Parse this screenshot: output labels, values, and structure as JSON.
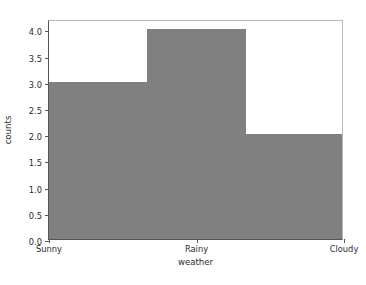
{
  "chart_data": {
    "type": "bar",
    "title": "",
    "subtitle": "",
    "xlabel": "weather",
    "ylabel": "counts",
    "categories": [
      "Sunny",
      "Rainy",
      "Cloudy"
    ],
    "values": [
      3.0,
      4.0,
      2.0
    ],
    "series": [
      {
        "name": "counts",
        "values": [
          3.0,
          4.0,
          2.0
        ]
      }
    ],
    "xlim": [
      0,
      3
    ],
    "ylim": [
      0.0,
      4.2
    ],
    "ytick_labels": [
      "0.0",
      "0.5",
      "1.0",
      "1.5",
      "2.0",
      "2.5",
      "3.0",
      "3.5",
      "4.0"
    ],
    "ytick_values": [
      0.0,
      0.5,
      1.0,
      1.5,
      2.0,
      2.5,
      3.0,
      3.5,
      4.0
    ],
    "xtick_labels": [
      "Sunny",
      "Rainy",
      "Cloudy"
    ],
    "xtick_values": [
      0,
      1.5,
      3
    ],
    "grid": false,
    "legend": false,
    "legend_position": "none",
    "bar_gap": 0,
    "colors": {
      "bar": "#808080",
      "background": "#ffffff",
      "axis": "#555555",
      "axis_light": "#b8b8b8",
      "text": "#2b2b2b"
    }
  }
}
